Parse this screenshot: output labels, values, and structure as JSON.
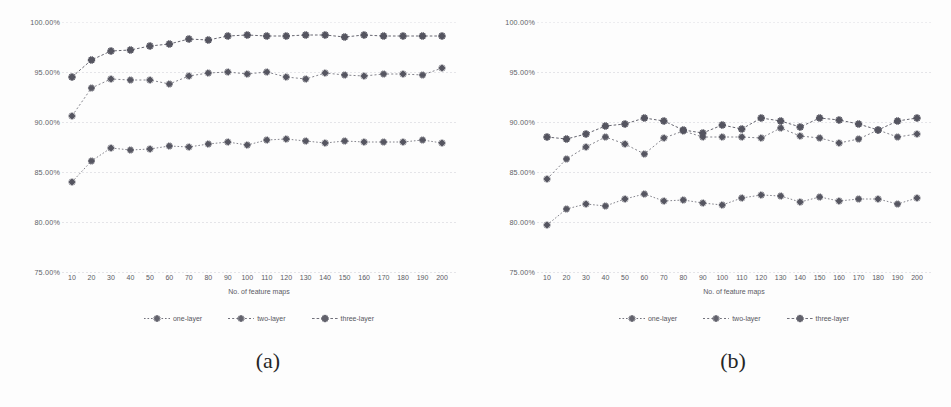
{
  "figure": {
    "panels": [
      {
        "id": "a",
        "caption": "(a)",
        "chart_data": {
          "type": "line",
          "title": "",
          "xlabel": "No. of feature maps",
          "ylabel": "",
          "x": [
            10,
            20,
            30,
            40,
            50,
            60,
            70,
            80,
            90,
            100,
            110,
            120,
            130,
            140,
            150,
            160,
            170,
            180,
            190,
            200
          ],
          "categories": [
            "10",
            "20",
            "30",
            "40",
            "50",
            "60",
            "70",
            "80",
            "90",
            "100",
            "110",
            "120",
            "130",
            "140",
            "150",
            "160",
            "170",
            "180",
            "190",
            "200"
          ],
          "xtick_labels": [
            "10",
            "20",
            "30",
            "40",
            "50",
            "60",
            "70",
            "80",
            "90",
            "100",
            "110",
            "120",
            "130",
            "140",
            "150",
            "160",
            "170",
            "180",
            "190",
            "200"
          ],
          "ytick_labels": [
            "100.00%",
            "95.00%",
            "90.00%",
            "85.00%",
            "80.00%",
            "75.00%"
          ],
          "ytick_values": [
            100,
            95,
            90,
            85,
            80,
            75
          ],
          "ylim": [
            75,
            100
          ],
          "xlim": [
            10,
            200
          ],
          "grid": true,
          "legend_position": "bottom",
          "series": [
            {
              "name": "one-layer",
              "values": [
                84.0,
                86.1,
                87.4,
                87.2,
                87.3,
                87.6,
                87.5,
                87.8,
                88.0,
                87.7,
                88.2,
                88.3,
                88.1,
                87.9,
                88.1,
                88.0,
                88.0,
                88.0,
                88.2,
                87.9
              ]
            },
            {
              "name": "two-layer",
              "values": [
                90.6,
                93.4,
                94.3,
                94.2,
                94.2,
                93.8,
                94.6,
                94.9,
                95.0,
                94.8,
                95.0,
                94.5,
                94.3,
                94.9,
                94.7,
                94.6,
                94.8,
                94.8,
                94.7,
                95.4
              ]
            },
            {
              "name": "three-layer",
              "values": [
                94.5,
                96.2,
                97.1,
                97.2,
                97.6,
                97.8,
                98.3,
                98.2,
                98.6,
                98.7,
                98.6,
                98.6,
                98.7,
                98.7,
                98.5,
                98.7,
                98.6,
                98.6,
                98.6,
                98.6
              ]
            }
          ]
        }
      },
      {
        "id": "b",
        "caption": "(b)",
        "chart_data": {
          "type": "line",
          "title": "",
          "xlabel": "No. of feature maps",
          "ylabel": "",
          "x": [
            10,
            20,
            30,
            40,
            50,
            60,
            70,
            80,
            90,
            100,
            110,
            120,
            130,
            140,
            150,
            160,
            170,
            180,
            190,
            200
          ],
          "categories": [
            "10",
            "20",
            "30",
            "40",
            "50",
            "60",
            "70",
            "80",
            "90",
            "100",
            "110",
            "120",
            "130",
            "140",
            "150",
            "160",
            "170",
            "180",
            "190",
            "200"
          ],
          "xtick_labels": [
            "10",
            "20",
            "30",
            "40",
            "50",
            "60",
            "70",
            "80",
            "90",
            "100",
            "110",
            "120",
            "130",
            "140",
            "150",
            "160",
            "170",
            "180",
            "190",
            "200"
          ],
          "ytick_labels": [
            "100.00%",
            "95.00%",
            "90.00%",
            "85.00%",
            "80.00%",
            "75.00%"
          ],
          "ytick_values": [
            100,
            95,
            90,
            85,
            80,
            75
          ],
          "ylim": [
            75,
            100
          ],
          "xlim": [
            10,
            200
          ],
          "grid": true,
          "legend_position": "bottom",
          "series": [
            {
              "name": "one-layer",
              "values": [
                79.7,
                81.3,
                81.8,
                81.6,
                82.3,
                82.8,
                82.1,
                82.2,
                81.9,
                81.7,
                82.4,
                82.7,
                82.6,
                82.0,
                82.5,
                82.1,
                82.3,
                82.3,
                81.8,
                82.4
              ]
            },
            {
              "name": "two-layer",
              "values": [
                84.3,
                86.3,
                87.5,
                88.5,
                87.8,
                86.8,
                88.4,
                89.1,
                88.5,
                88.5,
                88.5,
                88.4,
                89.4,
                88.6,
                88.4,
                87.9,
                88.3,
                89.2,
                88.5,
                88.8
              ]
            },
            {
              "name": "three-layer",
              "values": [
                88.5,
                88.3,
                88.8,
                89.6,
                89.8,
                90.4,
                90.1,
                89.2,
                88.9,
                89.7,
                89.3,
                90.4,
                90.1,
                89.5,
                90.4,
                90.2,
                89.8,
                89.2,
                90.1,
                90.4
              ]
            }
          ]
        }
      }
    ],
    "legend_labels": [
      "one-layer",
      "two-layer",
      "three-layer"
    ],
    "axis_title": "No. of feature maps",
    "colors": {
      "series_line": "#555560",
      "gridline": "#dcdce2",
      "text": "#4a4a52",
      "background": "#fdfdfd"
    }
  }
}
